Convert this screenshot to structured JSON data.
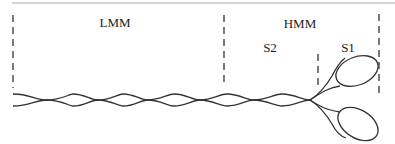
{
  "diagram": {
    "labels": {
      "lmm": "LMM",
      "hmm": "HMM",
      "s2": "S2",
      "s1": "S1"
    },
    "colors": {
      "stroke": "#333333",
      "rule": "#999999",
      "background": "#ffffff"
    },
    "regions": [
      {
        "name": "LMM",
        "x_start": 13,
        "x_end": 224
      },
      {
        "name": "HMM",
        "x_start": 224,
        "x_end": 379
      },
      {
        "name": "S2",
        "x_start": 224,
        "x_end": 318
      },
      {
        "name": "S1",
        "x_start": 318,
        "x_end": 379
      }
    ]
  }
}
